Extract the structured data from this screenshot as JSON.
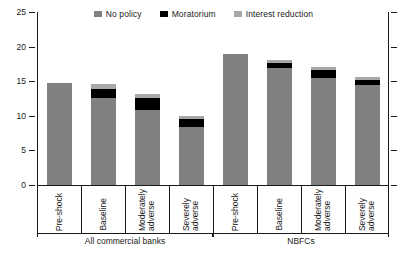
{
  "chart_data": {
    "type": "bar",
    "subtype": "stacked-bar-grouped",
    "title": "",
    "xlabel": "",
    "ylabel": "",
    "ylim": [
      0,
      25
    ],
    "yticks": [
      0,
      5,
      10,
      15,
      20,
      25
    ],
    "ytick_labels": [
      "0",
      "5",
      "10",
      "15",
      "20",
      "25"
    ],
    "grid": false,
    "legend_position": "top-center",
    "series": [
      {
        "name": "No policy",
        "color": "#808080",
        "values": [
          14.8,
          12.6,
          10.9,
          8.4,
          19.0,
          16.9,
          15.4,
          14.4
        ]
      },
      {
        "name": "Moratorium",
        "color": "#000000",
        "values": [
          0.0,
          1.3,
          1.7,
          1.2,
          0.0,
          0.8,
          1.2,
          0.8
        ]
      },
      {
        "name": "Interest reduction",
        "color": "#a8a8a8",
        "values": [
          0.0,
          0.7,
          0.6,
          0.4,
          0.0,
          0.4,
          0.4,
          0.4
        ]
      }
    ],
    "categories": [
      "Pre-shock",
      "Baseline",
      "Moderately\nadverse",
      "Severely\nadverse",
      "Pre-shock",
      "Baseline",
      "Moderately\nadverse",
      "Severely\nadverse"
    ],
    "totals": [
      14.8,
      14.6,
      13.2,
      10.0,
      19.0,
      18.1,
      17.0,
      15.6
    ],
    "groups": [
      {
        "label": "All commercial banks",
        "start": 0,
        "end": 3
      },
      {
        "label": "NBFCs",
        "start": 4,
        "end": 7
      }
    ]
  },
  "legend": {
    "items": [
      {
        "label": "No policy",
        "color": "#808080"
      },
      {
        "label": "Moratorium",
        "color": "#000000"
      },
      {
        "label": "Interest reduction",
        "color": "#a8a8a8"
      }
    ]
  }
}
